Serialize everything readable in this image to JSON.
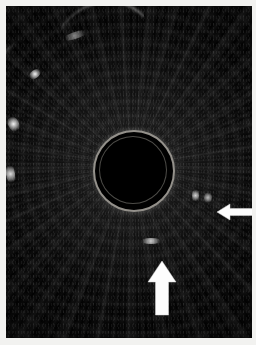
{
  "figure": {
    "kind": "medical-ultrasound-image",
    "modality": "Endoscopic ultrasound (radial EUS) cross-section",
    "caption": "",
    "background_color": "#f2f2f0",
    "scan_color": "#020202"
  },
  "scan": {
    "label": "ultrasound scan field",
    "center_x_pct": 51,
    "center_y_pct": 48,
    "texture": "radial speckle with concentric reverberation rings"
  },
  "probe": {
    "label": "central anechoic lumen with echogenic ring",
    "ring_color": "#bebab2",
    "core_color": "#000000"
  },
  "annotations": [
    {
      "name": "arrow-up",
      "label": "upward pointing arrow",
      "direction": "up",
      "color": "#fdfdfd"
    },
    {
      "name": "arrow-left",
      "label": "left pointing arrow",
      "direction": "left",
      "color": "#fdfdfd"
    }
  ],
  "features": {
    "bright_arcs": "echogenic wall layers at left margin",
    "bright_foci": "small hyperechoic foci adjacent to arrow tips"
  }
}
